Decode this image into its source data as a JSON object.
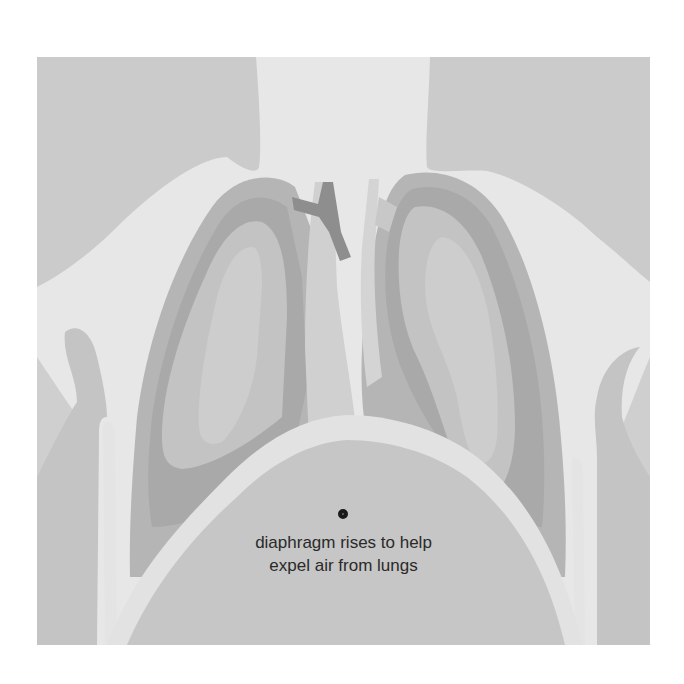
{
  "diagram": {
    "annotation": {
      "line1": "diaphragm rises to help",
      "line2": "expel air from lungs",
      "marker_icon": "bullet-marker-icon"
    },
    "colors": {
      "background": "#e7e7e7",
      "shoulders": "#cbcbcb",
      "ribcage_outer": "#c4c4c4",
      "rib_stripe": "#e4e4e4",
      "lung_outer": "#b5b5b5",
      "lung_mid": "#a9a9a9",
      "lung_inner": "#c3c3c3",
      "lung_core": "#cdcdcd",
      "trachea": "#d4d4d4",
      "bronchus_dark": "#8e8e8e",
      "diaphragm_band": "#e2e2e2",
      "abdomen": "#c6c6c6",
      "text": "#2a2a2a"
    }
  }
}
